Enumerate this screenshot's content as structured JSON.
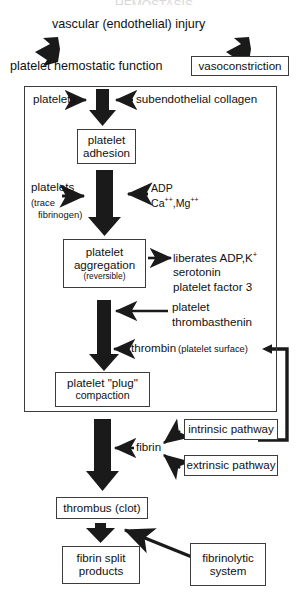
{
  "diagram": {
    "title_cut_off": "HEMOSTASIS",
    "top": {
      "stimulus": "vascular (endothelial) injury",
      "left_response": "platelet hemostatic function",
      "right_response": "vasoconstriction"
    },
    "platelet_phase": {
      "inputs": {
        "left": "platelets",
        "right": "subendothelial collagen"
      },
      "adhesion_box": {
        "line1": "platelet",
        "line2": "adhesion"
      },
      "aggregation_inputs": {
        "left_main": "platelets",
        "left_note_line1": "(trace",
        "left_note_line2": "fibrinogen)",
        "right_line1": "ADP",
        "right_line2_a": "Ca",
        "right_line2_sup_a": "++",
        "right_line2_sep": ",Mg",
        "right_line2_sup_b": "++"
      },
      "aggregation_box": {
        "line1": "platelet",
        "line2": "aggregation",
        "line3": "(reversible)"
      },
      "liberates": {
        "line1_a": "liberates ADP,K",
        "line1_sup": "+",
        "line2": "serotonin",
        "line3": "platelet factor 3"
      },
      "thrombasthenin": {
        "line1": "platelet",
        "line2": "thrombasthenin"
      },
      "thrombin": {
        "main": "thrombin",
        "paren": "(platelet surface)"
      },
      "plug_box": {
        "line1": "platelet \"plug\"",
        "line2": "compaction"
      }
    },
    "coagulation": {
      "fibrin": "fibrin",
      "intrinsic_pathway": "intrinsic pathway",
      "extrinsic_pathway": "extrinsic pathway",
      "thrombus_box": "thrombus (clot)",
      "fibrin_split_box": {
        "line1": "fibrin split",
        "line2": "products"
      },
      "fibrinolytic_box": {
        "line1": "fibrinolytic",
        "line2": "system"
      }
    },
    "colors": {
      "ink": "#111111",
      "box_border": "#3c3c3c",
      "arrow_fill": "#1a1a1a",
      "paper": "#ffffff"
    }
  }
}
